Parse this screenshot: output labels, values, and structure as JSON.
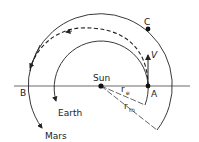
{
  "diagram": {
    "labels": {
      "sun": "Sun",
      "earth": "Earth",
      "mars": "Mars",
      "point_a": "A",
      "point_b": "B",
      "point_c": "C",
      "velocity": "V",
      "r_earth": "r",
      "r_earth_sub": "e",
      "r_mars": "r",
      "r_mars_sub": "m"
    },
    "colors": {
      "line": "#222222",
      "background": "#ffffff"
    }
  }
}
